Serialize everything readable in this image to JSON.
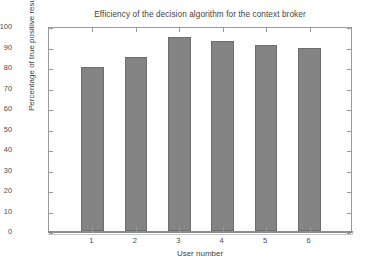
{
  "chart_data": {
    "type": "bar",
    "title": "Efficiency of the decision algorithm for the context broker",
    "xlabel": "User number",
    "ylabel": "Percentage of true positive results",
    "categories": [
      "1",
      "2",
      "3",
      "4",
      "5",
      "6"
    ],
    "values": [
      80,
      85,
      94.5,
      92.5,
      90.5,
      89.5
    ],
    "series": [
      {
        "name": "Percentage of true positive results",
        "values": [
          80,
          85,
          94.5,
          92.5,
          90.5,
          89.5
        ]
      }
    ],
    "ylim": [
      0,
      100
    ],
    "yticks": [
      0,
      10,
      20,
      30,
      40,
      50,
      60,
      70,
      80,
      90,
      100
    ],
    "ytick_labels": [
      "0",
      "10",
      "20",
      "30",
      "40",
      "50",
      "60",
      "70",
      "80",
      "90",
      "100"
    ],
    "xtick_labels": [
      "1",
      "2",
      "3",
      "4",
      "5",
      "6"
    ],
    "grid": false,
    "legend": null,
    "bar_color": "#848484",
    "bar_edge_color": "#6d6d6d",
    "axis_color": "#9a9a9a",
    "background_color": "#ffffff"
  }
}
